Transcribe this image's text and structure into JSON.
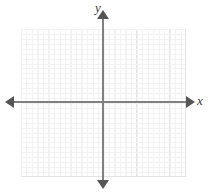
{
  "figure": {
    "type": "coordinate-plane",
    "title": "",
    "background_color": "#ffffff"
  },
  "axes": {
    "x": {
      "label": "x",
      "label_position": "right",
      "color": "#808080",
      "arrow_start": true,
      "arrow_end": true
    },
    "y": {
      "label": "y",
      "label_position": "top",
      "color": "#808080",
      "arrow_start": true,
      "arrow_end": true
    },
    "origin_marked": false,
    "tick_labels": []
  },
  "grid": {
    "visible": true,
    "major_color": "#e3e3e3",
    "minor_color": "#f2f2f2",
    "columns": 10,
    "rows": 10,
    "minor_per_major": 3,
    "numbers_shown": false
  },
  "chart_data": {
    "type": "scatter",
    "title": "",
    "xlabel": "x",
    "ylabel": "y",
    "x": [],
    "values": [],
    "series": [],
    "categories": [],
    "xlim": [
      -5,
      5
    ],
    "ylim": [
      -5,
      5
    ],
    "grid": true,
    "legend": "none",
    "annotations": [],
    "note": "Empty blank coordinate grid with labeled x and y axes; no plotted data points or curves."
  }
}
